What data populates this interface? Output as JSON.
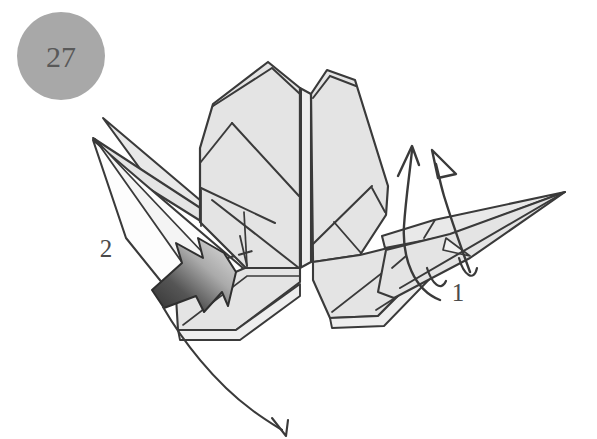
{
  "canvas": {
    "width": 597,
    "height": 439,
    "background": "#ffffff"
  },
  "style": {
    "paper_fill": "#e4e4e4",
    "paper_fill_light": "#ededed",
    "paper_fill_white": "#fdfdfd",
    "line_color": "#3a3a3a",
    "line_color_soft": "#4a4a4a",
    "step_circle_fill": "#a8a8a8",
    "step_number_color": "#595959",
    "push_arrow_dark": "#3d3d3d",
    "push_arrow_light": "#dcdcdc"
  },
  "step_badge": {
    "name": "step-number-badge",
    "number": "27",
    "cx": 61,
    "cy": 56,
    "r": 44,
    "font_size": 30
  },
  "labels": [
    {
      "name": "fold-label-1",
      "text": "1",
      "x": 458,
      "y": 301,
      "font_size": 25
    },
    {
      "name": "fold-label-2",
      "text": "2",
      "x": 106,
      "y": 257,
      "font_size": 25
    }
  ],
  "figure": {
    "title": "Origami folding step 27",
    "description": "Gray origami model with central pleated body, spiked left wing and pointed right wing, annotated with rotation arrows and a push-in arrow.",
    "parts": [
      {
        "name": "central-body-left-panel"
      },
      {
        "name": "central-body-right-panel"
      },
      {
        "name": "central-spine"
      },
      {
        "name": "left-wing-spikes"
      },
      {
        "name": "right-wing-point"
      },
      {
        "name": "lower-left-flap"
      },
      {
        "name": "lower-right-flap"
      }
    ]
  },
  "annotations": {
    "rotate_arrow_solid": {
      "name": "rotation-arrow-solid-head",
      "description": "Curved arrow with thin solid V head pointing up, wrapping behind right wing"
    },
    "rotate_arrow_hollow": {
      "name": "rotation-arrow-hollow-head",
      "description": "Curved arrow with hollow triangular head pointing up-left, wrapping behind right wing"
    },
    "push_arrow": {
      "name": "push-in-arrow",
      "description": "Short notched-tail arrow with dark-to-light gradient pointing up-right into the left wing"
    },
    "sweep_arrow": {
      "name": "sweep-fold-arrow",
      "description": "Long curved arrow sweeping from left wing down to bottom right"
    },
    "dashed_crease": {
      "name": "hidden-crease-dashed-line",
      "description": "Short dash-dot line marking a hidden crease in the left body"
    }
  }
}
